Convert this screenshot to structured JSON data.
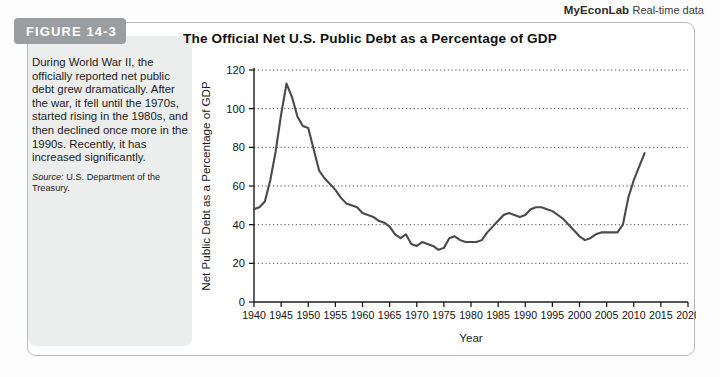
{
  "econlab": {
    "brand": "MyEconLab",
    "subtitle": "Real-time data"
  },
  "figure": {
    "badge_label": "FIGURE 14-3",
    "badge_color": "#9a9ea1",
    "caption": "During World War II, the officially reported net public debt grew dramatically. After the war, it fell until the 1970s, started rising in the 1980s, and then declined once more in the 1990s. Recently, it has increased significantly.",
    "source_label": "Source:",
    "source_text": "U.S. Department of the Treasury."
  },
  "chart_data": {
    "type": "line",
    "title": "The Official Net U.S. Public Debt as a Percentage of GDP",
    "xlabel": "Year",
    "ylabel": "Net Public Debt as a Percentage of GDP",
    "xlim": [
      1940,
      2020
    ],
    "ylim": [
      0,
      120
    ],
    "xticks": [
      1940,
      1945,
      1950,
      1955,
      1960,
      1965,
      1970,
      1975,
      1980,
      1985,
      1990,
      1995,
      2000,
      2005,
      2010,
      2015,
      2020
    ],
    "yticks": [
      0,
      20,
      40,
      60,
      80,
      100,
      120
    ],
    "grid": "horizontal-dotted",
    "legend": "none",
    "line_color": "#4a4a4a",
    "x": [
      1940,
      1941,
      1942,
      1943,
      1944,
      1945,
      1946,
      1947,
      1948,
      1949,
      1950,
      1951,
      1952,
      1953,
      1954,
      1955,
      1956,
      1957,
      1958,
      1959,
      1960,
      1961,
      1962,
      1963,
      1964,
      1965,
      1966,
      1967,
      1968,
      1969,
      1970,
      1971,
      1972,
      1973,
      1974,
      1975,
      1976,
      1977,
      1978,
      1979,
      1980,
      1981,
      1982,
      1983,
      1984,
      1985,
      1986,
      1987,
      1988,
      1989,
      1990,
      1991,
      1992,
      1993,
      1994,
      1995,
      1996,
      1997,
      1998,
      1999,
      2000,
      2001,
      2002,
      2003,
      2004,
      2005,
      2006,
      2007,
      2008,
      2009,
      2010,
      2011,
      2012
    ],
    "values": [
      48,
      49,
      52,
      63,
      78,
      97,
      113,
      106,
      96,
      91,
      90,
      79,
      68,
      64,
      61,
      58,
      54,
      51,
      50,
      49,
      46,
      45,
      44,
      42,
      41,
      39,
      35,
      33,
      35,
      30,
      29,
      31,
      30,
      29,
      27,
      28,
      33,
      34,
      32,
      31,
      31,
      31,
      32,
      36,
      39,
      42,
      45,
      46,
      45,
      44,
      45,
      48,
      49,
      49,
      48,
      47,
      45,
      43,
      40,
      37,
      34,
      32,
      33,
      35,
      36,
      36,
      36,
      36,
      40,
      54,
      63,
      70,
      77
    ],
    "annotations": {
      "peak": {
        "year": 1946,
        "value": 113
      },
      "trough": {
        "year": 1974,
        "value": 27
      },
      "end": {
        "year": 2012,
        "value": 77
      }
    }
  }
}
